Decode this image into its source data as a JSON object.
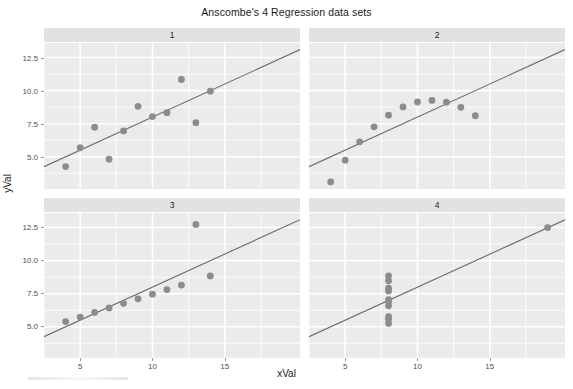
{
  "chart_data": {
    "type": "scatter",
    "title": "Anscombe's 4 Regression data sets",
    "xlabel": "xVal",
    "ylabel": "yVal",
    "grid": true,
    "legend": "none",
    "facet_layout": "2x2",
    "xlim": [
      2.5,
      20.2
    ],
    "ylim": [
      2.6,
      13.6
    ],
    "xticks": [
      5,
      10,
      15
    ],
    "xticklabels": [
      "5",
      "10",
      "15"
    ],
    "yticks": [
      5.0,
      7.5,
      10.0,
      12.5
    ],
    "yticklabels": [
      "5.0",
      "7.5",
      "10.0",
      "12.5"
    ],
    "point_color": "#8c8c8c",
    "line_color": "#6b6b6b",
    "panel_color": "#ebebeb",
    "strip_color": "#e2e2e2",
    "gridline_color": "#ffffff",
    "panels": [
      {
        "label": "1",
        "x": [
          10,
          8,
          13,
          9,
          11,
          14,
          6,
          4,
          12,
          7,
          5
        ],
        "y": [
          8.04,
          6.95,
          7.58,
          8.81,
          8.33,
          9.96,
          7.24,
          4.26,
          10.84,
          4.82,
          5.68
        ],
        "fit_intercept": 3.0,
        "fit_slope": 0.5
      },
      {
        "label": "2",
        "x": [
          10,
          8,
          13,
          9,
          11,
          14,
          6,
          4,
          12,
          7,
          5
        ],
        "y": [
          9.14,
          8.14,
          8.74,
          8.77,
          9.26,
          8.1,
          6.13,
          3.1,
          9.13,
          7.26,
          4.74
        ],
        "fit_intercept": 3.001,
        "fit_slope": 0.5
      },
      {
        "label": "3",
        "x": [
          10,
          8,
          13,
          9,
          11,
          14,
          6,
          4,
          12,
          7,
          5
        ],
        "y": [
          7.46,
          6.77,
          12.74,
          7.11,
          7.81,
          8.84,
          6.08,
          5.39,
          8.15,
          6.42,
          5.73
        ],
        "fit_intercept": 3.002,
        "fit_slope": 0.4997
      },
      {
        "label": "4",
        "x": [
          8,
          8,
          8,
          8,
          8,
          8,
          8,
          19,
          8,
          8,
          8
        ],
        "y": [
          6.58,
          5.76,
          7.71,
          8.84,
          8.47,
          7.04,
          5.25,
          12.5,
          5.56,
          7.91,
          6.89
        ],
        "fit_intercept": 3.0017,
        "fit_slope": 0.499
      }
    ]
  }
}
